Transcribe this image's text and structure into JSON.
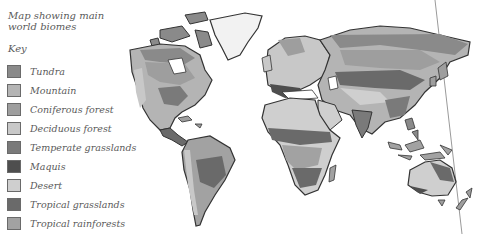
{
  "title": "Map showing main world biomes",
  "title_lines": [
    "Map showing main",
    "world biomes"
  ],
  "key_label": "Key",
  "legend": [
    {
      "label": "Tundra",
      "color": "#8a8a8a"
    },
    {
      "label": "Mountain",
      "color": "#b4b4b4"
    },
    {
      "label": "Coniferous forest",
      "color": "#9e9e9e"
    },
    {
      "label": "Deciduous forest",
      "color": "#c8c8c8"
    },
    {
      "label": "Temperate grasslands",
      "color": "#7a7a7a"
    },
    {
      "label": "Maquis",
      "color": "#4e4e4e"
    },
    {
      "label": "Desert",
      "color": "#cfcfcf"
    },
    {
      "label": "Tropical grasslands",
      "color": "#6a6a6a"
    },
    {
      "label": "Tropical rainforests",
      "color": "#a2a2a2"
    }
  ]
}
